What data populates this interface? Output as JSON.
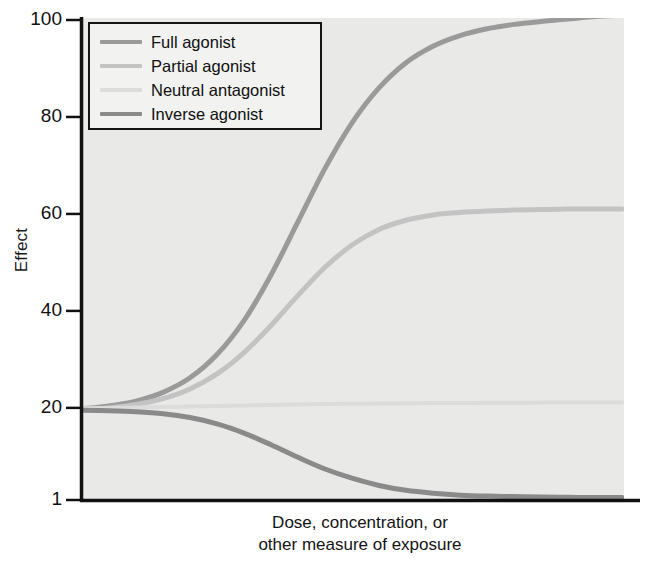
{
  "chart_data": {
    "type": "line",
    "title": "",
    "xlabel": "Dose, concentration, or other measure of exposure",
    "xlabel_lines": [
      "Dose, concentration, or",
      "other measure of exposure"
    ],
    "ylabel": "Effect",
    "ylim": [
      1,
      100
    ],
    "yticks": [
      100,
      80,
      60,
      40,
      20,
      1
    ],
    "ytick_labels": [
      "100",
      "80",
      "60",
      "40",
      "20",
      "1"
    ],
    "xticks": [],
    "xtick_labels": [],
    "grid": false,
    "legend_position": "upper-left-inside",
    "plot_background": "#e9e9e7",
    "axis_color": "#111111",
    "x": [
      0,
      0.05,
      0.1,
      0.15,
      0.2,
      0.25,
      0.3,
      0.35,
      0.4,
      0.45,
      0.5,
      0.55,
      0.6,
      0.65,
      0.7,
      0.75,
      0.8,
      0.85,
      0.9,
      0.95,
      1
    ],
    "series": [
      {
        "name": "Full agonist",
        "color": "#9a9a9a",
        "width": 5,
        "baseline": 20,
        "plateau": 101,
        "direction": "up",
        "midpoint": 0.47,
        "steepness": 9,
        "values": [
          19.8,
          20.4,
          21.4,
          23.2,
          26.2,
          31.0,
          38.0,
          47.4,
          58.4,
          69.4,
          78.8,
          86.0,
          91.2,
          94.6,
          96.8,
          98.2,
          99.1,
          99.7,
          100.2,
          100.7,
          101.0
        ]
      },
      {
        "name": "Partial agonist",
        "color": "#c3c3c3",
        "width": 5,
        "baseline": 20,
        "plateau": 61,
        "direction": "up",
        "midpoint": 0.45,
        "steepness": 7.5,
        "values": [
          19.6,
          20.0,
          20.7,
          21.9,
          23.9,
          27.0,
          31.4,
          37.0,
          43.2,
          49.0,
          53.6,
          56.8,
          58.7,
          59.8,
          60.3,
          60.6,
          60.8,
          60.9,
          61.0,
          61.0,
          61.0
        ]
      },
      {
        "name": "Neutral antagonist",
        "color": "#dcdcdc",
        "width": 4,
        "baseline": 20,
        "plateau": 21,
        "direction": "flat",
        "midpoint": 0.45,
        "steepness": 4,
        "values": [
          19.9,
          20.0,
          20.1,
          20.2,
          20.3,
          20.4,
          20.5,
          20.6,
          20.7,
          20.8,
          20.85,
          20.9,
          20.95,
          21.0,
          21.0,
          21.05,
          21.05,
          21.1,
          21.1,
          21.1,
          21.1
        ]
      },
      {
        "name": "Inverse agonist",
        "color": "#8a8a8a",
        "width": 5,
        "baseline": 19.5,
        "plateau": 1.5,
        "direction": "down",
        "midpoint": 0.46,
        "steepness": 8,
        "values": [
          19.5,
          19.4,
          19.2,
          18.8,
          18.0,
          16.7,
          14.8,
          12.4,
          9.8,
          7.4,
          5.5,
          4.0,
          3.0,
          2.4,
          2.0,
          1.8,
          1.7,
          1.6,
          1.55,
          1.5,
          1.5
        ]
      }
    ]
  },
  "legend": {
    "items": [
      {
        "label": "Full agonist",
        "color": "#9a9a9a"
      },
      {
        "label": "Partial agonist",
        "color": "#c3c3c3"
      },
      {
        "label": "Neutral antagonist",
        "color": "#dcdcdc"
      },
      {
        "label": "Inverse agonist",
        "color": "#8a8a8a"
      }
    ]
  }
}
